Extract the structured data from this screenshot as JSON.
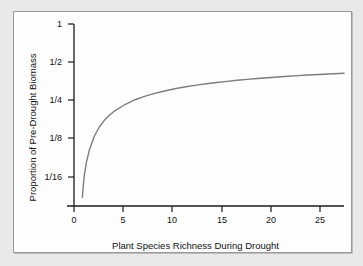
{
  "chart_data": {
    "type": "line",
    "title": "",
    "xlabel": "Plant Species Richness During Drought",
    "ylabel": "Proportion of Pre-Drought Biomass",
    "xlim": [
      0,
      26.5
    ],
    "ylim_log2": [
      -4.6,
      0
    ],
    "yscale": "log2",
    "grid": false,
    "legend": null,
    "xticks": [
      0,
      5,
      10,
      15,
      20,
      25
    ],
    "xticklabels": [
      "0",
      "5",
      "10",
      "15",
      "20",
      "25"
    ],
    "yticks": [
      1,
      0.5,
      0.25,
      0.125,
      0.0625
    ],
    "yticklabels": [
      "1",
      "1/2",
      "1/4",
      "1/8",
      "1/16"
    ],
    "series": [
      {
        "name": "Drought resistance curve",
        "color": "#7d7d7d",
        "linewidth": 1.4,
        "x": [
          0.82,
          0.9,
          1.0,
          1.2,
          1.5,
          2.0,
          2.5,
          3.0,
          3.5,
          4.0,
          5.0,
          6.0,
          7.0,
          8.0,
          9.0,
          10.0,
          11.0,
          12.0,
          13.0,
          14.0,
          15.0,
          16.0,
          17.0,
          18.0,
          19.0,
          20.0,
          21.0,
          22.0,
          23.0,
          24.0,
          25.0,
          26.0,
          26.5
        ],
        "y": [
          0.043,
          0.052,
          0.063,
          0.08,
          0.101,
          0.131,
          0.155,
          0.175,
          0.192,
          0.207,
          0.232,
          0.253,
          0.27,
          0.285,
          0.298,
          0.31,
          0.32,
          0.33,
          0.338,
          0.346,
          0.353,
          0.36,
          0.366,
          0.372,
          0.377,
          0.382,
          0.387,
          0.392,
          0.396,
          0.4,
          0.404,
          0.407,
          0.409
        ]
      }
    ]
  },
  "axes": {
    "x_title": "Plant Species Richness During Drought",
    "y_title": "Proportion of Pre-Drought Biomass",
    "x_tick_labels": [
      "0",
      "5",
      "10",
      "15",
      "20",
      "25"
    ],
    "y_tick_labels": [
      "1",
      "1/2",
      "1/4",
      "1/8",
      "1/16"
    ]
  },
  "colors": {
    "curve": "#7d7d7d",
    "axis": "#1a1a1a",
    "page_background": "#e9e9e9",
    "plot_background": "#fdfdfd",
    "frame_border": "#9a9a9a"
  }
}
